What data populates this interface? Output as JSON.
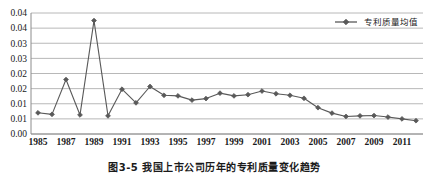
{
  "figure": {
    "caption": "图3-5  我国上市公司历年的专利质量变化趋势"
  },
  "chart_data": {
    "type": "line",
    "title": "",
    "xlabel": "",
    "ylabel": "",
    "legend_position": "top-right",
    "grid": true,
    "gridline_axis": "y",
    "ylim": [
      0,
      0.04
    ],
    "ytick_step": 0.005,
    "ytick_values": [
      0.04,
      0.035,
      0.03,
      0.025,
      0.02,
      0.015,
      0.01,
      0.005,
      0
    ],
    "ytick_labels": [
      "0.04",
      "0.04",
      "0.03",
      "0.03",
      "0.02",
      "0.02",
      "0.01",
      "0.01",
      "0.00"
    ],
    "xtick_labels": [
      "1985",
      "1987",
      "1989",
      "1991",
      "1993",
      "1995",
      "1997",
      "1999",
      "2001",
      "2003",
      "2005",
      "2007",
      "2009",
      "2011"
    ],
    "x": [
      1985,
      1986,
      1987,
      1988,
      1989,
      1990,
      1991,
      1992,
      1993,
      1994,
      1995,
      1996,
      1997,
      1998,
      1999,
      2000,
      2001,
      2002,
      2003,
      2004,
      2005,
      2006,
      2007,
      2008,
      2009,
      2010,
      2011,
      2012
    ],
    "series": [
      {
        "name": "专利质量均值",
        "color": "#595959",
        "marker": "diamond",
        "values": [
          0.007,
          0.0065,
          0.018,
          0.0063,
          0.0375,
          0.006,
          0.0148,
          0.0103,
          0.0157,
          0.0128,
          0.0126,
          0.0112,
          0.0117,
          0.0135,
          0.0126,
          0.013,
          0.0142,
          0.0133,
          0.0128,
          0.0118,
          0.0087,
          0.0069,
          0.0058,
          0.006,
          0.0061,
          0.0056,
          0.005,
          0.0044
        ]
      }
    ]
  }
}
